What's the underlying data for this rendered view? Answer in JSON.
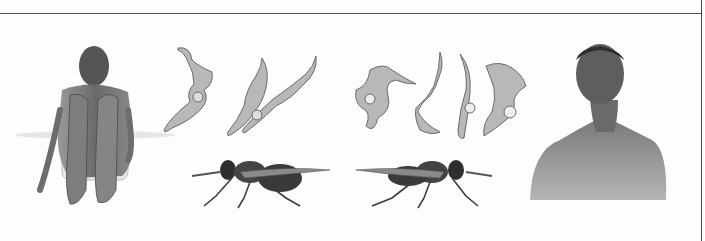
{
  "figure": {
    "panels": [
      {
        "id": "patient-seated",
        "description": "Seated patient hugging knees"
      },
      {
        "id": "trypanosomes-left",
        "description": "Two trypanosome parasites"
      },
      {
        "id": "tsetse-fly-left",
        "description": "Tsetse fly side view, facing left"
      },
      {
        "id": "trypanosomes-right",
        "description": "Four trypanosome parasites"
      },
      {
        "id": "tsetse-fly-right",
        "description": "Tsetse fly side view, facing right"
      },
      {
        "id": "patient-bust",
        "description": "Bust portrait of a man with swollen neck glands"
      }
    ],
    "colors": {
      "background": "#fdfdfd",
      "border": "#555555",
      "parasite_fill": "#b8b8b8",
      "parasite_outline": "#6a6a6a",
      "skin": "#6e6e6e",
      "fly": "#3a3a3a"
    }
  }
}
